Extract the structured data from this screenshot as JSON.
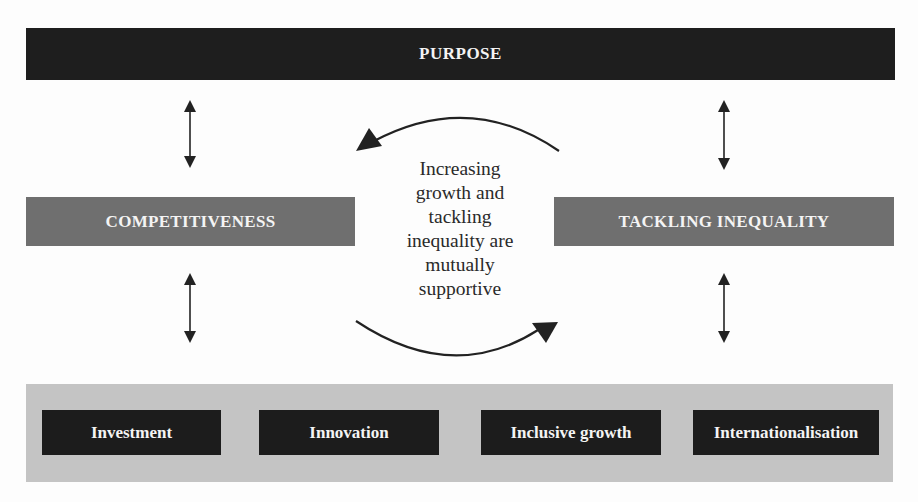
{
  "diagram": {
    "top_bar": {
      "label": "PURPOSE"
    },
    "left_box": {
      "label": "COMPETITIVENESS"
    },
    "right_box": {
      "label": "TACKLING INEQUALITY"
    },
    "center_text": {
      "lines": [
        "Increasing",
        "growth and",
        "tackling",
        "inequality are",
        "mutually",
        "supportive"
      ]
    },
    "pillars": [
      {
        "label": "Investment"
      },
      {
        "label": "Innovation"
      },
      {
        "label": "Inclusive growth"
      },
      {
        "label": "Internationalisation"
      }
    ],
    "connectors": [
      {
        "type": "double-arrow",
        "from": "PURPOSE",
        "to": "COMPETITIVENESS"
      },
      {
        "type": "double-arrow",
        "from": "PURPOSE",
        "to": "TACKLING INEQUALITY"
      },
      {
        "type": "double-arrow",
        "from": "COMPETITIVENESS",
        "to": "pillars"
      },
      {
        "type": "double-arrow",
        "from": "TACKLING INEQUALITY",
        "to": "pillars"
      },
      {
        "type": "curved-arrow",
        "from": "TACKLING INEQUALITY",
        "to": "COMPETITIVENESS"
      },
      {
        "type": "curved-arrow",
        "from": "COMPETITIVENESS",
        "to": "TACKLING INEQUALITY"
      }
    ],
    "colors": {
      "dark_box": "#1e1e1e",
      "mid_box": "#6f6f6f",
      "band": "#c4c4c4",
      "text_on_dark": "#f4f4f4",
      "arrow": "#222222"
    }
  }
}
